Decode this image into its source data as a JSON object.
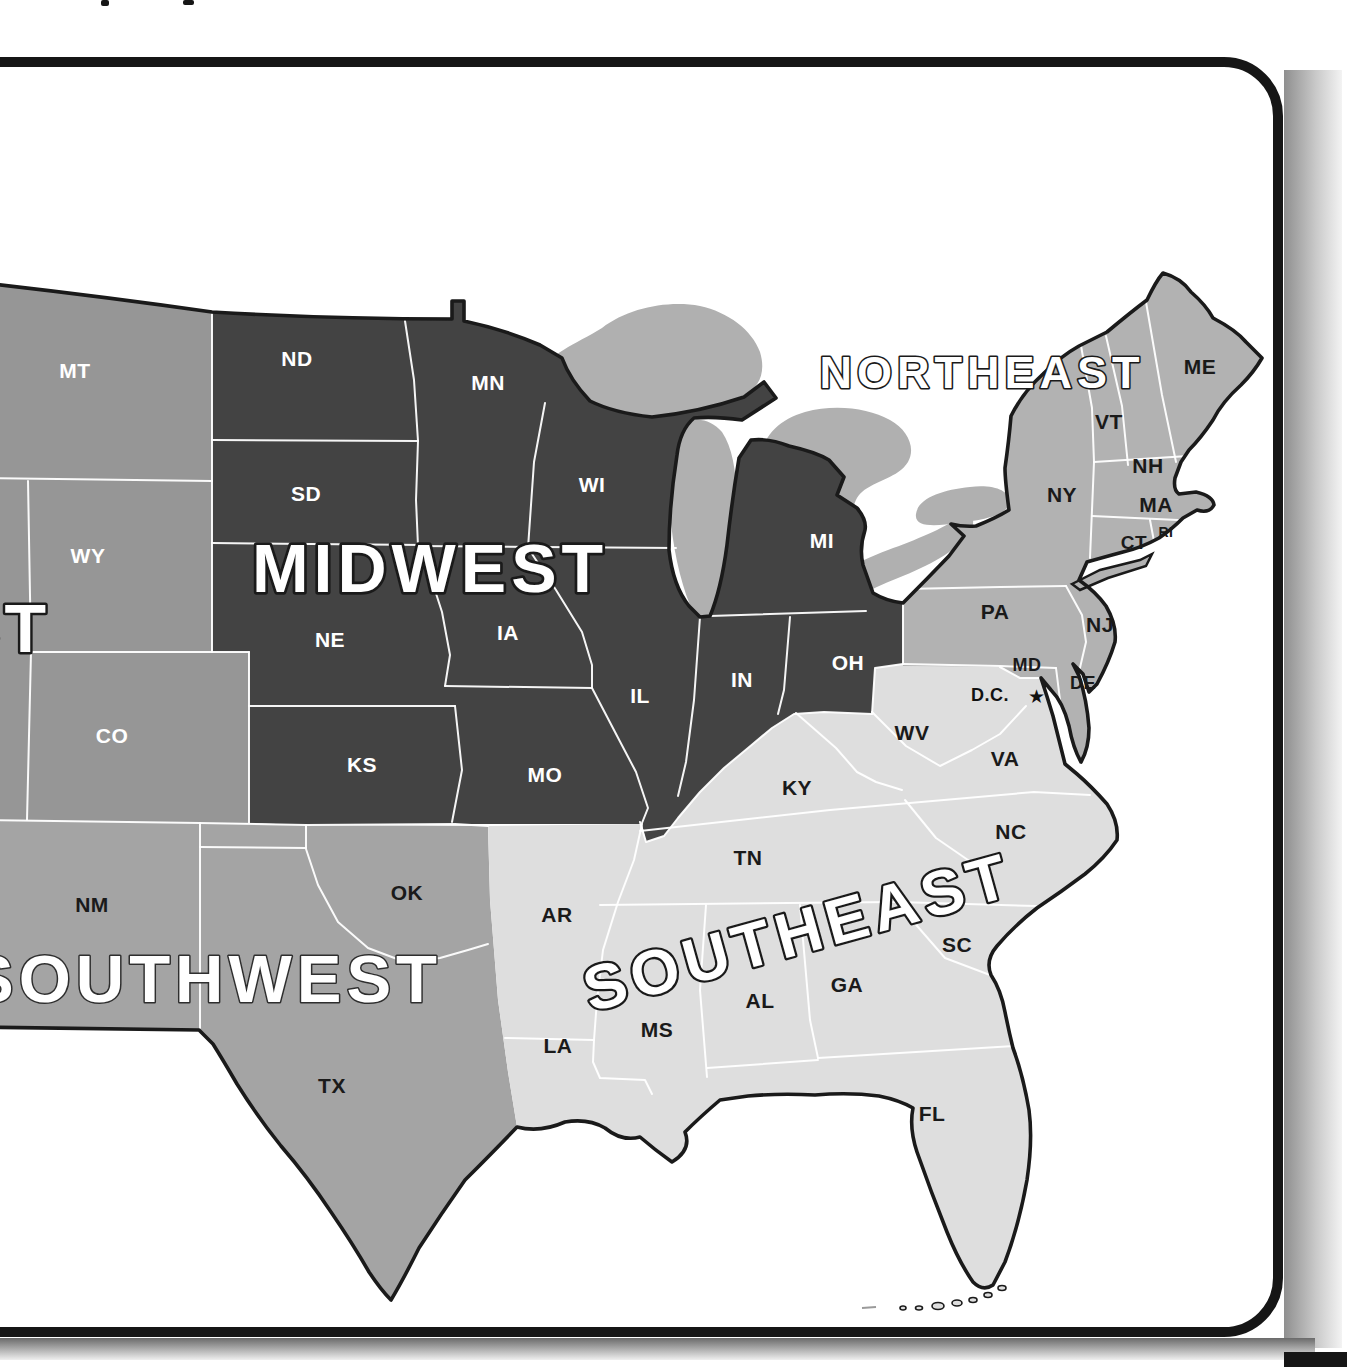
{
  "page": {
    "background": "#ffffff",
    "frame_color": "#161616",
    "shadow_dark": "#6a6a6a",
    "bottom_right_bar_color": "#161616",
    "cropped_text_remnants": "two tiny letter fragments at top edge"
  },
  "map": {
    "title_note": "United States regions map",
    "outline_color": "#1a1a1a",
    "state_border_color": "#ffffff",
    "lakes_fill": "#b0b0b0",
    "regions": [
      {
        "id": "west",
        "label": "WEST",
        "fill": "#969696",
        "label_fill": "#ffffff",
        "label_outline": "#1a1a1a",
        "label_outline_width": 5,
        "label_x": 50,
        "label_y": 652,
        "label_size": 68,
        "label_spacing": 4,
        "label_anchor": "end",
        "label_rotation": 0,
        "label_pivot_x": 50,
        "label_pivot_y": 628
      },
      {
        "id": "midwest",
        "label": "MIDWEST",
        "fill": "#434343",
        "label_fill": "#ffffff",
        "label_outline": "#1a1a1a",
        "label_outline_width": 5.5,
        "label_x": 430,
        "label_y": 592,
        "label_size": 68,
        "label_spacing": 5,
        "label_anchor": "middle",
        "label_rotation": 0,
        "label_pivot_x": 430,
        "label_pivot_y": 568
      },
      {
        "id": "northeast",
        "label": "NORTHEAST",
        "fill": "#b2b2b2",
        "label_fill": "#ffffff",
        "label_outline": "#1a1a1a",
        "label_outline_width": 3.2,
        "label_x": 982,
        "label_y": 388,
        "label_size": 45,
        "label_spacing": 5,
        "label_anchor": "middle",
        "label_rotation": 0,
        "label_pivot_x": 982,
        "label_pivot_y": 372
      },
      {
        "id": "southeast",
        "label": "SOUTHEAST",
        "fill": "#dedede",
        "label_fill": "#ffffff",
        "label_outline": "#1a1a1a",
        "label_outline_width": 4.5,
        "label_x": 798,
        "label_y": 954,
        "label_size": 63,
        "label_spacing": 6,
        "label_anchor": "middle",
        "label_rotation": -15.5,
        "label_pivot_x": 798,
        "label_pivot_y": 932
      },
      {
        "id": "southwest",
        "label": "SOUTHWEST",
        "fill": "#a4a4a4",
        "label_fill": "#ffffff",
        "label_outline": "#2e2e2e",
        "label_outline_width": 3,
        "label_x": 442,
        "label_y": 1002,
        "label_size": 67,
        "label_spacing": 5,
        "label_anchor": "end",
        "label_rotation": 0,
        "label_pivot_x": 442,
        "label_pivot_y": 978
      }
    ],
    "states": [
      {
        "abbr": "MT",
        "x": 75,
        "y": 378,
        "color": "#ffffff",
        "size": 21
      },
      {
        "abbr": "WY",
        "x": 88,
        "y": 563,
        "color": "#ffffff",
        "size": 21
      },
      {
        "abbr": "CO",
        "x": 112,
        "y": 743,
        "color": "#ffffff",
        "size": 21
      },
      {
        "abbr": "ND",
        "x": 297,
        "y": 366,
        "color": "#ffffff",
        "size": 21
      },
      {
        "abbr": "SD",
        "x": 306,
        "y": 501,
        "color": "#ffffff",
        "size": 21
      },
      {
        "abbr": "MN",
        "x": 488,
        "y": 390,
        "color": "#ffffff",
        "size": 21
      },
      {
        "abbr": "WI",
        "x": 592,
        "y": 492,
        "color": "#ffffff",
        "size": 21
      },
      {
        "abbr": "MI",
        "x": 822,
        "y": 548,
        "color": "#ffffff",
        "size": 21
      },
      {
        "abbr": "NE",
        "x": 330,
        "y": 647,
        "color": "#ffffff",
        "size": 21
      },
      {
        "abbr": "IA",
        "x": 508,
        "y": 640,
        "color": "#ffffff",
        "size": 21
      },
      {
        "abbr": "IL",
        "x": 640,
        "y": 703,
        "color": "#ffffff",
        "size": 21
      },
      {
        "abbr": "IN",
        "x": 742,
        "y": 687,
        "color": "#ffffff",
        "size": 21
      },
      {
        "abbr": "OH",
        "x": 848,
        "y": 670,
        "color": "#ffffff",
        "size": 21
      },
      {
        "abbr": "KS",
        "x": 362,
        "y": 772,
        "color": "#ffffff",
        "size": 21
      },
      {
        "abbr": "MO",
        "x": 545,
        "y": 782,
        "color": "#ffffff",
        "size": 21
      },
      {
        "abbr": "ME",
        "x": 1200,
        "y": 374,
        "color": "#1a1a1a",
        "size": 21
      },
      {
        "abbr": "VT",
        "x": 1109,
        "y": 429,
        "color": "#1a1a1a",
        "size": 21
      },
      {
        "abbr": "NH",
        "x": 1148,
        "y": 473,
        "color": "#1a1a1a",
        "size": 21
      },
      {
        "abbr": "NY",
        "x": 1062,
        "y": 502,
        "color": "#1a1a1a",
        "size": 21
      },
      {
        "abbr": "MA",
        "x": 1156,
        "y": 512,
        "color": "#1a1a1a",
        "size": 21
      },
      {
        "abbr": "RI",
        "x": 1166,
        "y": 537,
        "color": "#1a1a1a",
        "size": 14,
        "weight": "600"
      },
      {
        "abbr": "CT",
        "x": 1134,
        "y": 549,
        "color": "#1a1a1a",
        "size": 19
      },
      {
        "abbr": "PA",
        "x": 995,
        "y": 619,
        "color": "#1a1a1a",
        "size": 21
      },
      {
        "abbr": "NJ",
        "x": 1100,
        "y": 632,
        "color": "#1a1a1a",
        "size": 21
      },
      {
        "abbr": "MD",
        "x": 1027,
        "y": 671,
        "color": "#1a1a1a",
        "size": 18
      },
      {
        "abbr": "DE",
        "x": 1083,
        "y": 689,
        "color": "#1a1a1a",
        "size": 18
      },
      {
        "abbr": "WV",
        "x": 912,
        "y": 740,
        "color": "#1a1a1a",
        "size": 21
      },
      {
        "abbr": "VA",
        "x": 1005,
        "y": 766,
        "color": "#1a1a1a",
        "size": 21
      },
      {
        "abbr": "KY",
        "x": 797,
        "y": 795,
        "color": "#1a1a1a",
        "size": 21
      },
      {
        "abbr": "NC",
        "x": 1011,
        "y": 839,
        "color": "#1a1a1a",
        "size": 21
      },
      {
        "abbr": "TN",
        "x": 748,
        "y": 865,
        "color": "#1a1a1a",
        "size": 21
      },
      {
        "abbr": "SC",
        "x": 957,
        "y": 952,
        "color": "#1a1a1a",
        "size": 21
      },
      {
        "abbr": "GA",
        "x": 847,
        "y": 992,
        "color": "#1a1a1a",
        "size": 21
      },
      {
        "abbr": "AL",
        "x": 760,
        "y": 1008,
        "color": "#1a1a1a",
        "size": 21
      },
      {
        "abbr": "MS",
        "x": 657,
        "y": 1037,
        "color": "#1a1a1a",
        "size": 21
      },
      {
        "abbr": "AR",
        "x": 557,
        "y": 922,
        "color": "#1a1a1a",
        "size": 21
      },
      {
        "abbr": "LA",
        "x": 558,
        "y": 1053,
        "color": "#1a1a1a",
        "size": 21
      },
      {
        "abbr": "FL",
        "x": 932,
        "y": 1121,
        "color": "#1a1a1a",
        "size": 21
      },
      {
        "abbr": "NM",
        "x": 92,
        "y": 912,
        "color": "#1a1a1a",
        "size": 21
      },
      {
        "abbr": "OK",
        "x": 407,
        "y": 900,
        "color": "#1a1a1a",
        "size": 21
      },
      {
        "abbr": "TX",
        "x": 332,
        "y": 1093,
        "color": "#1a1a1a",
        "size": 21
      }
    ],
    "dc": {
      "label": "D.C.",
      "x": 990,
      "y": 701,
      "star": "★",
      "star_x": 1036,
      "star_y": 703,
      "color": "#111111",
      "size": 18
    }
  }
}
